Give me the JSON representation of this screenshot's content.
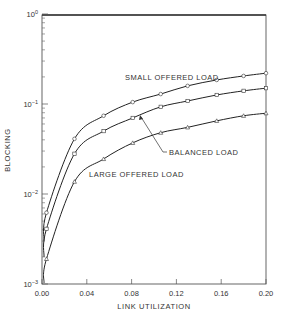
{
  "chart_data": {
    "type": "line",
    "title": "",
    "xlabel": "LINK UTILIZATION",
    "ylabel": "BLOCKING",
    "xlim": [
      0.0,
      0.2
    ],
    "ylim": [
      0.001,
      1.0
    ],
    "yscale": "log",
    "grid": false,
    "legend": "inline annotations",
    "x_ticks": [
      "0.00",
      "0.04",
      "0.08",
      "0.12",
      "0.16",
      "0.20"
    ],
    "y_ticks": [
      "10^-3",
      "10^-2",
      "10^-1",
      "10^0"
    ],
    "x": [
      0.004,
      0.029,
      0.055,
      0.081,
      0.106,
      0.13,
      0.156,
      0.18,
      0.2
    ],
    "series": [
      {
        "name": "SMALL OFFERED LOAD",
        "marker": "circle",
        "values": [
          0.0062,
          0.041,
          0.074,
          0.105,
          0.129,
          0.159,
          0.185,
          0.205,
          0.22
        ]
      },
      {
        "name": "BALANCED LOAD",
        "marker": "square",
        "values": [
          0.0041,
          0.028,
          0.05,
          0.07,
          0.093,
          0.108,
          0.126,
          0.14,
          0.15
        ]
      },
      {
        "name": "LARGE OFFERED LOAD",
        "marker": "triangle",
        "values": [
          0.0019,
          0.0137,
          0.0245,
          0.037,
          0.048,
          0.055,
          0.065,
          0.074,
          0.079
        ]
      }
    ],
    "annotations": [
      {
        "text": "SMALL OFFERED LOAD",
        "target": "upper curve"
      },
      {
        "text": "BALANCED LOAD",
        "target": "middle curve",
        "arrow": true
      },
      {
        "text": "LARGE OFFERED LOAD",
        "target": "lower curve"
      }
    ]
  },
  "labels": {
    "xlabel": "LINK UTILIZATION",
    "ylabel": "BLOCKING",
    "small": "SMALL OFFERED LOAD",
    "balanced": "BALANCED LOAD",
    "large": "LARGE OFFERED LOAD"
  }
}
